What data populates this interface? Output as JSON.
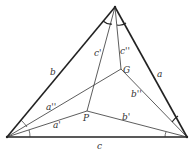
{
  "diagram": {
    "vertices": {
      "top": {
        "x": 115,
        "y": 7
      },
      "left": {
        "x": 7,
        "y": 137
      },
      "right": {
        "x": 187,
        "y": 137
      },
      "P": {
        "x": 87,
        "y": 111
      },
      "G": {
        "x": 121,
        "y": 69
      }
    },
    "labels": {
      "side_a": "a",
      "side_b": "b",
      "side_c": "c",
      "seg_a1": "a'",
      "seg_a2": "a''",
      "seg_b1": "b'",
      "seg_b2": "b''",
      "seg_c1": "c'",
      "seg_c2": "c''",
      "point_P": "P",
      "point_G": "G"
    },
    "colors": {
      "stroke": "#222222",
      "background": "#ffffff"
    }
  }
}
